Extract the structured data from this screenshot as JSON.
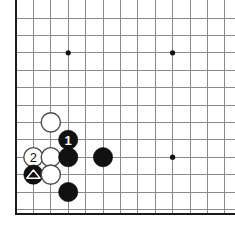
{
  "figure": {
    "kind": "go-board-diagram",
    "width": 235,
    "height": 237,
    "background_color": "#ffffff"
  },
  "board": {
    "line_color": "#8a8a8a",
    "edge_color": "#1a1a1a",
    "star_color": "#111111",
    "grid_spacing": 17.4,
    "origin_x": 16,
    "origin_y": 18,
    "columns": 13,
    "rows": 12,
    "left_edge_x": 16,
    "bottom_edge_y": 214,
    "edges": [
      "left",
      "bottom"
    ],
    "star_points": [
      {
        "name": "star-point-upper-left",
        "col": 3,
        "row": 2
      },
      {
        "name": "star-point-upper-right",
        "col": 9,
        "row": 2
      },
      {
        "name": "star-point-lower-right",
        "col": 9,
        "row": 8
      }
    ]
  },
  "stones": [
    {
      "id": "white-stone-a",
      "color": "white",
      "col": 2,
      "row": 6,
      "label": "",
      "mark": ""
    },
    {
      "id": "black-stone-move-1",
      "color": "black",
      "col": 3,
      "row": 7,
      "label": "1",
      "mark": ""
    },
    {
      "id": "white-stone-move-2",
      "color": "white",
      "col": 1,
      "row": 8,
      "label": "2",
      "mark": ""
    },
    {
      "id": "white-stone-b",
      "color": "white",
      "col": 2,
      "row": 8,
      "label": "",
      "mark": ""
    },
    {
      "id": "black-stone-b",
      "color": "black",
      "col": 3,
      "row": 8,
      "label": "",
      "mark": ""
    },
    {
      "id": "black-stone-c",
      "color": "black",
      "col": 5,
      "row": 8,
      "label": "",
      "mark": ""
    },
    {
      "id": "black-stone-triangle",
      "color": "black",
      "col": 1,
      "row": 9,
      "label": "",
      "mark": "triangle"
    },
    {
      "id": "white-stone-c",
      "color": "white",
      "col": 2,
      "row": 9,
      "label": "",
      "mark": ""
    },
    {
      "id": "black-stone-d",
      "color": "black",
      "col": 3,
      "row": 10,
      "label": "",
      "mark": ""
    }
  ],
  "colors": {
    "black_stone": "#111111",
    "white_stone": "#ffffff",
    "white_stone_outline": "#4a4a4a",
    "grid": "#8a8a8a",
    "edge": "#1a1a1a",
    "label_on_black": "#ffffff",
    "label_on_white": "#111111",
    "triangle_mark": "#ffffff"
  }
}
